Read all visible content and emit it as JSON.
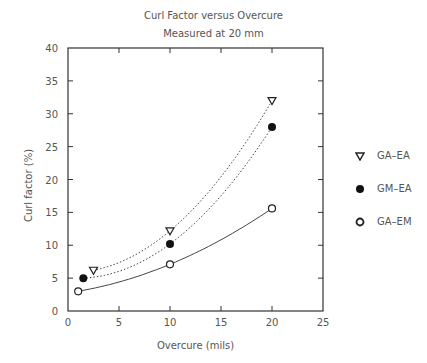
{
  "chart_data": {
    "type": "scatter",
    "title": "Curl Factor versus Overcure",
    "subtitle": "Measured at 20 mm",
    "xlabel": "Overcure (mils)",
    "ylabel": "Curl factor (%)",
    "xlim": [
      0,
      25
    ],
    "ylim": [
      0,
      40
    ],
    "xticks": [
      0,
      5,
      10,
      15,
      20,
      25
    ],
    "yticks": [
      0,
      5,
      10,
      15,
      20,
      25,
      30,
      35,
      40
    ],
    "grid": false,
    "legend_position": "right",
    "series": [
      {
        "name": "GA–EA",
        "marker": "open-triangle-down",
        "line": "dotted",
        "x": [
          2.5,
          10,
          20
        ],
        "y": [
          6.2,
          12.2,
          32
        ]
      },
      {
        "name": "GM–EA",
        "marker": "filled-circle",
        "line": "dotted",
        "x": [
          1.5,
          10,
          20
        ],
        "y": [
          5,
          10.2,
          28
        ]
      },
      {
        "name": "GA–EM",
        "marker": "open-circle",
        "line": "solid",
        "x": [
          1,
          10,
          20
        ],
        "y": [
          3,
          7.1,
          15.6
        ]
      }
    ]
  }
}
